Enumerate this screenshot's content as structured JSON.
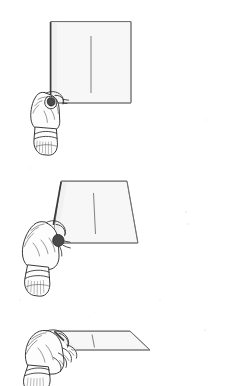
{
  "figure": {
    "title": "Hand holding a sheet of paper at three rotation angles",
    "background_color": "#ffffff",
    "paper_fill_color": "#f7f7f7",
    "ink_color": "#2f2f2f",
    "panel_count": 3,
    "width": 234,
    "height": 386
  },
  "panels": [
    {
      "id": "panel-1",
      "label": "Frontal view",
      "shape": "square",
      "description": "Sheet seen face-on as an upright square; hand grips the lower-left corner from behind, thumb visible over the front face.",
      "rotation_degrees": 0,
      "paper": {
        "corners_label": "top-left, top-right, bottom-right, bottom-left",
        "has_crease": true,
        "crease_orientation": "vertical",
        "crease_position": "center"
      },
      "hand": {
        "side": "left",
        "grip": "pinch at lower-left corner",
        "visible_parts": [
          "knuckles",
          "thumb",
          "thumbnail",
          "wrist",
          "cuff"
        ]
      }
    },
    {
      "id": "panel-2",
      "label": "Oblique view",
      "shape": "trapezoid",
      "description": "Sheet rotated about its vertical axis so it appears as a trapezoid narrower at the top; hand grips the lower-left corner.",
      "rotation_degrees": 45,
      "paper": {
        "corners_label": "top-left, top-right, bottom-right, bottom-left",
        "has_crease": true,
        "crease_orientation": "vertical",
        "crease_position": "center"
      },
      "hand": {
        "side": "left",
        "grip": "pinch at lower-left corner",
        "visible_parts": [
          "knuckles",
          "fingers",
          "thumb",
          "wrist",
          "cuff"
        ]
      }
    },
    {
      "id": "panel-3",
      "label": "Near edge-on view",
      "shape": "flat parallelogram",
      "description": "Sheet rotated almost fully so only a thin foreshortened band is visible; fingers curl around the near edge.",
      "rotation_degrees": 80,
      "paper": {
        "corners_label": "top-left, top-right, bottom-right, bottom-left",
        "has_crease": true,
        "crease_orientation": "vertical",
        "crease_position": "center"
      },
      "hand": {
        "side": "left",
        "grip": "fingers curled under the near edge",
        "visible_parts": [
          "knuckles",
          "four fingers",
          "thumb",
          "wrist",
          "cuff"
        ]
      }
    }
  ],
  "icons": {
    "paper_sheet": "paper-sheet-icon",
    "hand": "hand-icon",
    "crease": "crease-line-icon"
  }
}
